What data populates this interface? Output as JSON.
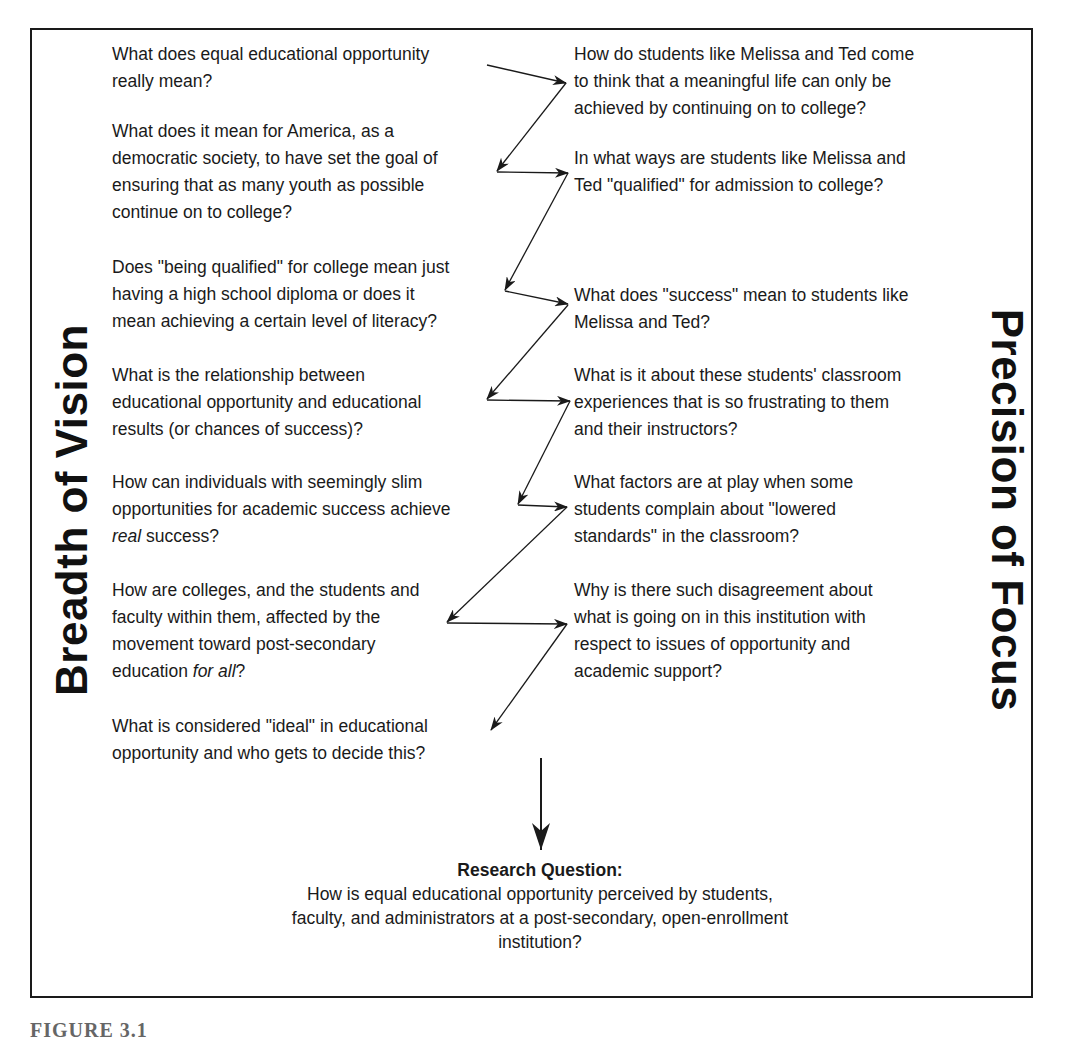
{
  "diagram": {
    "left_title": "Breadth of Vision",
    "right_title": "Precision of Focus",
    "left_questions": [
      {
        "text": "What does equal educational opportunity\nreally mean?"
      },
      {
        "text": "What does it mean for America, as a\ndemocratic society, to have set the goal of\nensuring that as many youth as possible\ncontinue on to college?"
      },
      {
        "text": "Does \"being qualified\" for college mean just\nhaving a high school diploma or does it\nmean achieving a certain level of literacy?"
      },
      {
        "text": "What is the relationship between\neducational opportunity and educational\nresults (or chances of success)?"
      },
      {
        "pre": "How can individuals with seemingly slim\nopportunities for academic success achieve\n",
        "em": "real",
        "post": " success?"
      },
      {
        "pre": "How are colleges, and the students and\nfaculty within them, affected by the\nmovement toward post-secondary\neducation ",
        "em": "for all",
        "post": "?"
      },
      {
        "text": "What is considered \"ideal\" in educational\nopportunity and who gets to decide this?"
      }
    ],
    "right_questions": [
      {
        "text": "How do students like Melissa and Ted come\nto think that a meaningful life can only be\nachieved by continuing on to college?"
      },
      {
        "text": "In what ways are students like Melissa and\nTed \"qualified\" for admission to college?"
      },
      {
        "text": "What does \"success\" mean to students like\nMelissa and Ted?"
      },
      {
        "text": "What is it about these students' classroom\nexperiences that is so frustrating to them\nand their instructors?"
      },
      {
        "text": "What factors are at play when some\nstudents complain about \"lowered\nstandards\" in the classroom?"
      },
      {
        "text": "Why is there such disagreement about\nwhat is going on in this institution with\nrespect to issues of opportunity and\nacademic support?"
      }
    ],
    "research_question": {
      "heading": "Research Question:",
      "text": "How is equal educational opportunity perceived by students, faculty, and administrators at a post-secondary, open-enrollment institution?"
    },
    "caption": "FIGURE 3.1",
    "colors": {
      "ink": "#1a1a1a",
      "background": "#ffffff"
    }
  }
}
